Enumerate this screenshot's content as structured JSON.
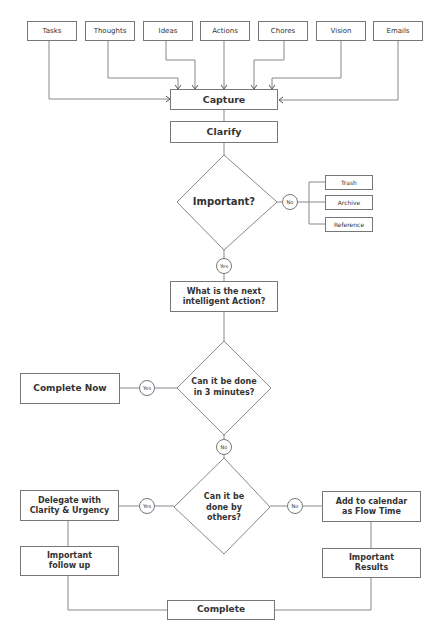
{
  "inputs": [
    "Tasks",
    "Thoughts",
    "Ideas",
    "Actions",
    "Chores",
    "Vision",
    "Emails"
  ],
  "capture": "Capture",
  "clarify": "Clarify",
  "important_question": "Important?",
  "important_no": "No",
  "important_yes": "Yes",
  "discard_options": [
    "Trash",
    "Archive",
    "Reference"
  ],
  "next_action": "What is the next intelligent Action?",
  "three_minutes_question": "Can it be done in 3 minutes?",
  "three_minutes_yes": "Yes",
  "three_minutes_no": "No",
  "complete_now": "Complete Now",
  "others_question": "Can it be done by others?",
  "others_yes": "Yes",
  "others_no": "No",
  "delegate": "Delegate with Clarity & Urgency",
  "important_follow_up": "Important follow up",
  "calendar": "Add to calendar as Flow Time",
  "important_results": "Important Results",
  "complete": "Complete"
}
